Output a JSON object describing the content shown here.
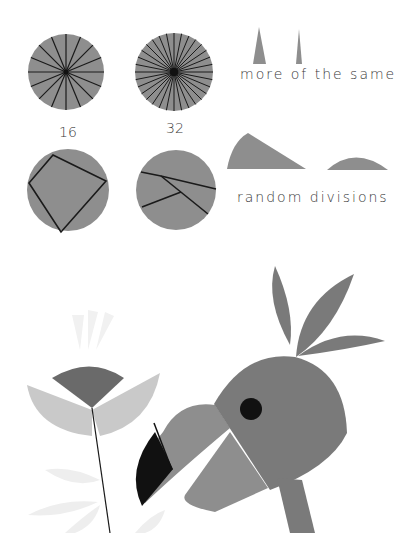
{
  "labels": {
    "count_16": "16",
    "count_32": "32",
    "more_of_the_same": "more of the same",
    "random_divisions": "random divisions"
  },
  "colors": {
    "mid_gray": "#8e8e8e",
    "dark_gray": "#6a6a6a",
    "light_gray": "#c9c9c9",
    "faint_gray": "#ececec",
    "black": "#111111",
    "line": "#1a1a1a"
  }
}
